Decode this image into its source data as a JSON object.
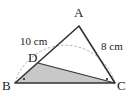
{
  "figure": {
    "type": "geometry-triangle",
    "colors": {
      "line": "#333333",
      "shade": "#c8c8c8",
      "arc": "#999999",
      "background": "#ffffff"
    },
    "points": {
      "A": {
        "label": "A",
        "x": 79,
        "y": 26
      },
      "B": {
        "label": "B",
        "x": 15,
        "y": 83
      },
      "C": {
        "label": "C",
        "x": 115,
        "y": 83
      },
      "D": {
        "label": "D",
        "x": 38,
        "y": 63
      }
    },
    "lengths": {
      "AB": "10 cm",
      "AC": "8 cm"
    },
    "shaded_region": "triangle DBC",
    "angle_marks": [
      "B",
      "C"
    ],
    "arc": "dashed arc through B, A, C"
  }
}
